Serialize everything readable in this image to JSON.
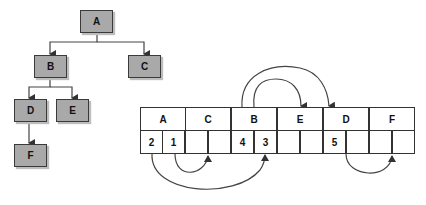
{
  "tree": {
    "nodes": [
      {
        "id": "A",
        "label": "A"
      },
      {
        "id": "B",
        "label": "B"
      },
      {
        "id": "C",
        "label": "C"
      },
      {
        "id": "D",
        "label": "D"
      },
      {
        "id": "E",
        "label": "E"
      },
      {
        "id": "F",
        "label": "F"
      }
    ],
    "edges": [
      [
        "A",
        "B"
      ],
      [
        "A",
        "C"
      ],
      [
        "B",
        "D"
      ],
      [
        "B",
        "E"
      ],
      [
        "D",
        "F"
      ]
    ]
  },
  "array": {
    "headers": [
      "A",
      "C",
      "B",
      "E",
      "D",
      "F"
    ],
    "slots": [
      "2",
      "1",
      "",
      "",
      "4",
      "3",
      "",
      "",
      "5",
      "",
      "",
      ""
    ]
  },
  "colors": {
    "node_fill": "#a9a9a9",
    "stroke": "#333333"
  }
}
